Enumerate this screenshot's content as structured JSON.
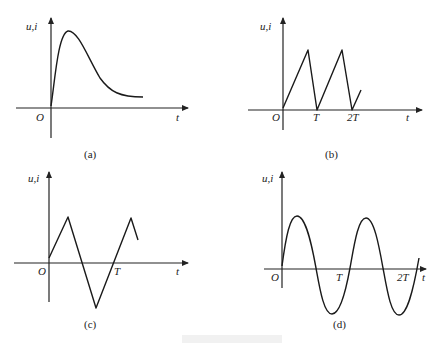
{
  "figure": {
    "panels": [
      {
        "id": "a",
        "caption": "(a)",
        "y_label": "u,i",
        "x_label": "t",
        "origin_label": "O",
        "tick_labels": [],
        "waveform": "single-pulse"
      },
      {
        "id": "b",
        "caption": "(b)",
        "y_label": "u,i",
        "x_label": "t",
        "origin_label": "O",
        "tick_labels": [
          "T",
          "2T"
        ],
        "waveform": "sawtooth"
      },
      {
        "id": "c",
        "caption": "(c)",
        "y_label": "u,i",
        "x_label": "t",
        "origin_label": "O",
        "tick_labels": [
          "T"
        ],
        "waveform": "triangle"
      },
      {
        "id": "d",
        "caption": "(d)",
        "y_label": "u,i",
        "x_label": "t",
        "origin_label": "O",
        "tick_labels": [
          "T",
          "2T"
        ],
        "waveform": "sine"
      }
    ]
  },
  "colors": {
    "line": "#1a1a1a",
    "background": "#ffffff"
  }
}
